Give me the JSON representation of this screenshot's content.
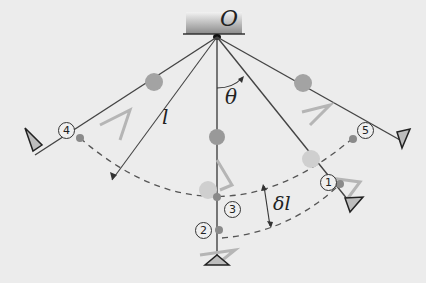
{
  "diagram": {
    "type": "pendulum-swing-diagram",
    "pivot_label": "O",
    "length_label": "l",
    "angle_label": "θ",
    "delta_label": "δl",
    "positions": [
      {
        "id": 1,
        "label": "①"
      },
      {
        "id": 2,
        "label": "②"
      },
      {
        "id": 3,
        "label": "③"
      },
      {
        "id": 4,
        "label": "④"
      },
      {
        "id": 5,
        "label": "⑤"
      }
    ],
    "colors": {
      "background": "#ececec",
      "rope": "#555555",
      "bob": "#8f8f8f",
      "ghost_bob": "#b9b9b9",
      "dashed_arc": "#555555",
      "mount": "#9a9a9a"
    }
  }
}
